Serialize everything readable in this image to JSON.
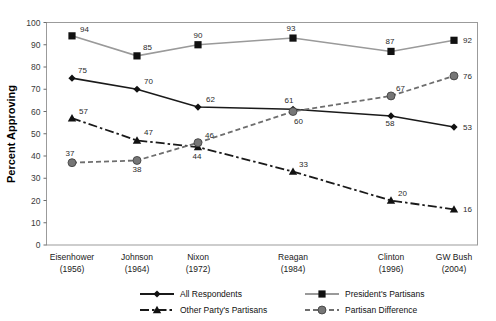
{
  "chart_data": {
    "type": "line",
    "title": "",
    "xlabel": "",
    "ylabel": "Percent Approving",
    "ylim": [
      0,
      100
    ],
    "ytick_step": 10,
    "yticks": [
      "0",
      "10",
      "20",
      "30",
      "40",
      "50",
      "60",
      "70",
      "80",
      "90",
      "100"
    ],
    "grid": false,
    "legend_position": "bottom",
    "categories": [
      "Eisenhower",
      "Johnson",
      "Nixon",
      "Reagan",
      "Clinton",
      "GW Bush"
    ],
    "category_years": [
      "(1956)",
      "(1964)",
      "(1972)",
      "(1984)",
      "(1996)",
      "(2004)"
    ],
    "x_positions_px": [
      72,
      137,
      198,
      293,
      391,
      454
    ],
    "series": [
      {
        "name": "All Respondents",
        "marker": "diamond",
        "color": "#1a1a1a",
        "dash": "none",
        "values": [
          75,
          70,
          62,
          61,
          58,
          53
        ],
        "label_offsets": [
          {
            "dx": 6,
            "dy": -5
          },
          {
            "dx": 7,
            "dy": -5
          },
          {
            "dx": 8,
            "dy": -5
          },
          {
            "dx": -4,
            "dy": -6
          },
          {
            "dx": -1,
            "dy": 10
          },
          {
            "dx": 9,
            "dy": 3
          }
        ]
      },
      {
        "name": "President's Partisans",
        "marker": "square",
        "color": "#9a9a9a",
        "dash": "none",
        "values": [
          94,
          85,
          90,
          93,
          87,
          92
        ],
        "label_offsets": [
          {
            "dx": 8,
            "dy": -4
          },
          {
            "dx": 6,
            "dy": -6
          },
          {
            "dx": 0,
            "dy": -7
          },
          {
            "dx": -2,
            "dy": -7
          },
          {
            "dx": -1,
            "dy": -7
          },
          {
            "dx": 9,
            "dy": 3
          }
        ]
      },
      {
        "name": "Other Party's Partisans",
        "marker": "triangle",
        "color": "#1a1a1a",
        "dash": "dashdot",
        "values": [
          57,
          47,
          44,
          33,
          20,
          16
        ],
        "label_offsets": [
          {
            "dx": 7,
            "dy": -4
          },
          {
            "dx": 7,
            "dy": -5
          },
          {
            "dx": -1,
            "dy": 12
          },
          {
            "dx": 6,
            "dy": -5
          },
          {
            "dx": 7,
            "dy": -5
          },
          {
            "dx": 9,
            "dy": 3
          }
        ]
      },
      {
        "name": "Partisan Difference",
        "marker": "circle",
        "color": "#6e6e6e",
        "dash": "dotted",
        "values": [
          37,
          38,
          46,
          60,
          67,
          76
        ],
        "label_offsets": [
          {
            "dx": -2,
            "dy": -7
          },
          {
            "dx": 0,
            "dy": 12
          },
          {
            "dx": 7,
            "dy": -5
          },
          {
            "dx": 1,
            "dy": 12
          },
          {
            "dx": 5,
            "dy": -5
          },
          {
            "dx": 9,
            "dy": 3
          }
        ]
      }
    ],
    "legend": [
      {
        "label": "All Respondents",
        "marker": "diamond",
        "color": "#1a1a1a",
        "dash": "none"
      },
      {
        "label": "President's Partisans",
        "marker": "square",
        "color": "#9a9a9a",
        "dash": "none"
      },
      {
        "label": "Other Party's Partisans",
        "marker": "triangle",
        "color": "#1a1a1a",
        "dash": "dashdot"
      },
      {
        "label": "Partisan Difference",
        "marker": "circle",
        "color": "#6e6e6e",
        "dash": "dotted"
      }
    ]
  }
}
